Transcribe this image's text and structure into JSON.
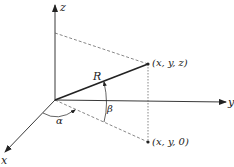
{
  "diagram": {
    "axes": {
      "x_label": "x",
      "y_label": "y",
      "z_label": "z"
    },
    "vector_label": "R",
    "angles": {
      "alpha": "α",
      "beta": "β"
    },
    "points": {
      "tip": "(x, y, z)",
      "projection": "(x, y, 0)"
    },
    "colors": {
      "ink": "#222222",
      "dashed": "#555555"
    }
  }
}
